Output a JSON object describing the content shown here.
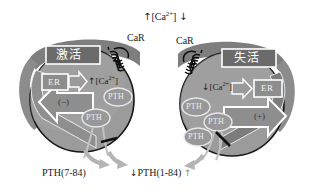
{
  "figure": {
    "title_top": "[Ca2+]",
    "top_label": {
      "up_arrow": "↑",
      "text": "[Ca",
      "sup": "2+",
      "text_end": "]",
      "down_arrow": "↓"
    },
    "background_color": "#ffffff",
    "cell_fill_color": "#9a9a9a",
    "ring_color": "#8a8a8a",
    "ring_dark_color": "#6f6f6f",
    "outline_color": "#1a1a1a",
    "arrow_outline_color": "#ffffff",
    "gray_arrow_color": "#b0b0b0"
  },
  "left_cell": {
    "state_label": "激活",
    "receptor_label": "CaR",
    "receptor_icon": "coiled-receptor-icon",
    "er_label": "ER",
    "calcium_arrow": "↑",
    "calcium_label": "[Ca",
    "calcium_sup": "2+",
    "calcium_label_end": "]",
    "sign_label": "(−)",
    "pth_vesicles": [
      "PTH",
      "PTH"
    ],
    "secretion_label": "PTH(7-84)"
  },
  "right_cell": {
    "state_label": "失活",
    "receptor_label": "CaR",
    "receptor_icon": "coiled-receptor-icon",
    "er_label": "ER",
    "calcium_arrow": "↓",
    "calcium_label": "[Ca",
    "calcium_sup": "2+",
    "calcium_label_end": "]",
    "sign_label": "(+)",
    "pth_vesicles": [
      "PTH",
      "PTH",
      "PTH"
    ],
    "secretion_label": "PTH(1-84)"
  },
  "bottom": {
    "center_down_arrow": "↓",
    "center_label": "PTH(1-84)",
    "center_up_arrow": "↑",
    "left_label": "PTH(7-84)"
  }
}
